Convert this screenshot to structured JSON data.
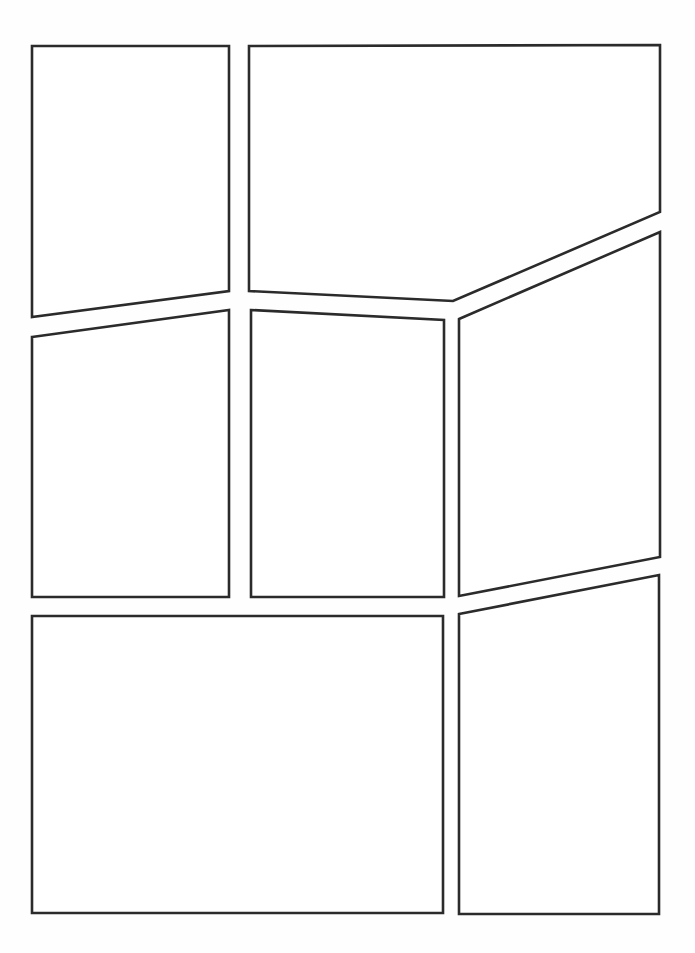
{
  "page": {
    "width": 695,
    "height": 953,
    "background": "#ffffff",
    "border_color": "#2b2b2b",
    "border_width": 2.6
  },
  "panels": [
    {
      "id": "panel-1",
      "points": "32,46 229,46 229,291 32,317"
    },
    {
      "id": "panel-2",
      "points": "249,46 660,45 660,212 453,301 249,291"
    },
    {
      "id": "panel-3",
      "points": "32,337 229,310 229,597 32,597"
    },
    {
      "id": "panel-4",
      "points": "251,310 444,320 444,597 251,597"
    },
    {
      "id": "panel-5",
      "points": "459,319 660,232 660,557 459,596"
    },
    {
      "id": "panel-6",
      "points": "32,616 443,616 443,913 32,913"
    },
    {
      "id": "panel-7",
      "points": "459,614 659,575 659,914 459,914"
    }
  ]
}
